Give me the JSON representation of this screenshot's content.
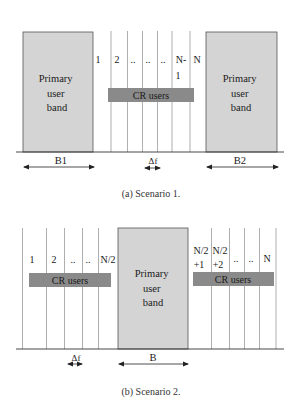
{
  "colors": {
    "primary_band_fill": "#d4d4d4",
    "primary_band_stroke": "#555555",
    "cr_bar_fill": "#8a8a8a",
    "cr_bar_text": "#1a1a1a",
    "grid_line": "#9a9a9a",
    "axis_line": "#333333"
  },
  "scenario1": {
    "caption": "(a) Scenario 1.",
    "primary_left": {
      "lines": [
        "Primary",
        "user",
        "band"
      ]
    },
    "primary_right": {
      "lines": [
        "Primary",
        "user",
        "band"
      ]
    },
    "channel_labels": [
      {
        "text": "1",
        "x": 98,
        "y": 63
      },
      {
        "text": "2",
        "x": 117,
        "y": 63
      },
      {
        "text": "..",
        "x": 133,
        "y": 63
      },
      {
        "text": "..",
        "x": 148,
        "y": 63
      },
      {
        "text": "..",
        "x": 163,
        "y": 63
      },
      {
        "text": "N-",
        "x": 181,
        "y": 63
      },
      {
        "text": "1",
        "x": 178,
        "y": 79
      },
      {
        "text": "N",
        "x": 197,
        "y": 63
      }
    ],
    "cr_bar_label": "CR users",
    "bandwidth_left_label": "B1",
    "bandwidth_right_label": "B2",
    "delta_f_label": "Δf"
  },
  "scenario2": {
    "caption": "(b) Scenario 2.",
    "primary_center": {
      "lines": [
        "Primary",
        "user",
        "band"
      ]
    },
    "channel_labels": [
      {
        "text": "1",
        "x": 32,
        "y": 263
      },
      {
        "text": "2",
        "x": 54,
        "y": 263
      },
      {
        "text": "..",
        "x": 73,
        "y": 263
      },
      {
        "text": "..",
        "x": 88,
        "y": 263
      },
      {
        "text": "N/2",
        "x": 108,
        "y": 263
      },
      {
        "text": "N/2",
        "x": 201,
        "y": 254
      },
      {
        "text": "+1",
        "x": 199,
        "y": 268
      },
      {
        "text": "N/2",
        "x": 220,
        "y": 254
      },
      {
        "text": "+2",
        "x": 218,
        "y": 268
      },
      {
        "text": "..",
        "x": 236,
        "y": 262
      },
      {
        "text": "..",
        "x": 251,
        "y": 262
      },
      {
        "text": "N",
        "x": 267,
        "y": 262
      }
    ],
    "cr_bar_left_label": "CR users",
    "cr_bar_right_label": "CR users",
    "bandwidth_label": "B",
    "delta_f_label": "Δf"
  }
}
